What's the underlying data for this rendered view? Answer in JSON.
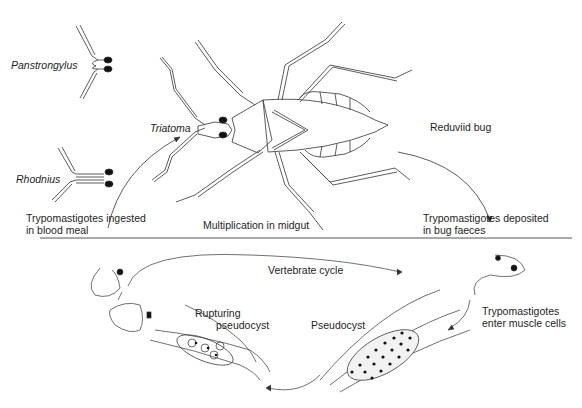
{
  "diagram": {
    "title_hint": "Life cycle of Trypanosoma cruzi",
    "insect_cycle": {
      "vector_genera": [
        "Panstrongylus",
        "Rhodnius",
        "Triatoma"
      ],
      "vector_label": "Reduviid bug",
      "stage_ingested": [
        "Trypomastigotes ingested",
        "in blood meal"
      ],
      "stage_midgut": "Multiplication in midgut",
      "stage_deposited": [
        "Trypomastigotes deposited",
        "in bug faeces"
      ]
    },
    "vertebrate_cycle": {
      "label": "Vertebrate cycle",
      "stage_enter": [
        "Trypomastigotes",
        "enter muscle cells"
      ],
      "stage_pseudocyst": "Pseudocyst",
      "stage_rupturing": [
        "Rupturing",
        "pseudocyst"
      ]
    },
    "colors": {
      "line": "#333333",
      "text": "#1e1e1e",
      "divider": "#555555"
    }
  }
}
